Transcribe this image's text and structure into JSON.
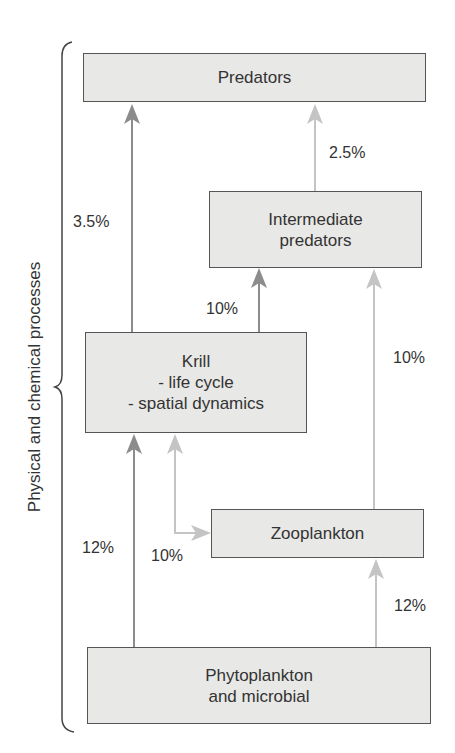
{
  "diagram": {
    "side_label": "Physical and chemical processes",
    "nodes": {
      "predators": {
        "lines": [
          "Predators"
        ]
      },
      "intermediate": {
        "lines": [
          "Intermediate",
          "predators"
        ]
      },
      "krill": {
        "lines": [
          "Krill",
          "- life cycle",
          "- spatial dynamics"
        ]
      },
      "zooplankton": {
        "lines": [
          "Zooplankton"
        ]
      },
      "phytoplankton": {
        "lines": [
          "Phytoplankton",
          "and microbial"
        ]
      }
    },
    "edges": [
      {
        "from": "krill",
        "to": "predators",
        "label": "3.5%",
        "shade": "dark"
      },
      {
        "from": "intermediate",
        "to": "predators",
        "label": "2.5%",
        "shade": "light"
      },
      {
        "from": "krill",
        "to": "intermediate",
        "label": "10%",
        "shade": "dark"
      },
      {
        "from": "zooplankton",
        "to": "intermediate",
        "label": "10%",
        "shade": "light"
      },
      {
        "from": "phytoplankton",
        "to": "krill",
        "label": "12%",
        "shade": "dark"
      },
      {
        "from": "zooplankton",
        "to": "krill",
        "label": "10%",
        "shade": "light"
      },
      {
        "from": "phytoplankton",
        "to": "zooplankton",
        "label": "12%",
        "shade": "light"
      }
    ],
    "colors": {
      "box_fill": "#e8e8e6",
      "box_border": "#555555",
      "arrow_dark": "#8c8c8c",
      "arrow_light": "#c4c4c4",
      "text": "#333333"
    }
  }
}
